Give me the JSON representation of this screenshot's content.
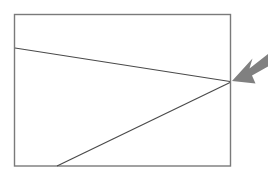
{
  "page": {
    "title": "Line diagram with pointer arrow",
    "background_color": "#ffffff",
    "width": 268,
    "height": 178
  },
  "diagram": {
    "type": "line-diagram",
    "frame": {
      "name": "rectangle-frame",
      "x": 14.5,
      "y": 14.5,
      "width": 216,
      "height": 151.5,
      "stroke_color": "#7a7a7a",
      "stroke_width": 1.4,
      "fill": "none"
    },
    "lines": [
      {
        "name": "upper-line",
        "x1": 15,
        "y1": 48,
        "x2": 230,
        "y2": 81.5,
        "stroke_color": "#4a4a4a",
        "stroke_width": 1.2
      },
      {
        "name": "lower-line",
        "x1": 57,
        "y1": 166,
        "x2": 230,
        "y2": 82.5,
        "stroke_color": "#4a4a4a",
        "stroke_width": 1.2
      }
    ],
    "intersection_point": {
      "name": "convergence-point",
      "x": 230,
      "y": 82
    },
    "arrow": {
      "name": "pointer-arrow",
      "direction": "left-down",
      "fill_color": "#808080",
      "tip_x": 232,
      "tip_y": 80,
      "tail_x": 268,
      "tail_y": 55,
      "points": "232,80 250,56 247,66 268,52 268,62 250,72 254,80"
    }
  }
}
